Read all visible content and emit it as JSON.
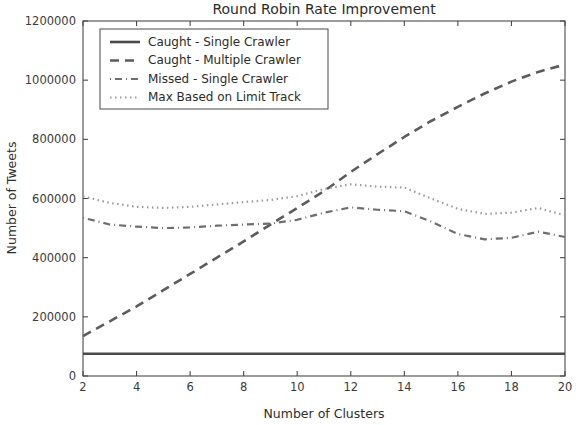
{
  "figure": {
    "width": 576,
    "height": 425,
    "background": "#ffffff"
  },
  "chart_data": {
    "type": "line",
    "title": "Round Robin Rate Improvement",
    "xlabel": "Number of Clusters",
    "ylabel": "Number of Tweets",
    "xlim": [
      2,
      20
    ],
    "ylim": [
      0,
      1200000
    ],
    "xticks": [
      2,
      4,
      6,
      8,
      10,
      12,
      14,
      16,
      18,
      20
    ],
    "xticklabels": [
      "2",
      "4",
      "6",
      "8",
      "10",
      "12",
      "14",
      "16",
      "18",
      "20"
    ],
    "yticks": [
      0,
      200000,
      400000,
      600000,
      800000,
      1000000,
      1200000
    ],
    "yticklabels": [
      "0",
      "200000",
      "400000",
      "600000",
      "800000",
      "1000000",
      "1200000"
    ],
    "grid": false,
    "legend_position": "upper left",
    "x": [
      2,
      3,
      4,
      5,
      6,
      7,
      8,
      9,
      10,
      11,
      12,
      13,
      14,
      15,
      16,
      17,
      18,
      19,
      20
    ],
    "series": [
      {
        "name": "Caught - Single Crawler",
        "linestyle": "solid",
        "color": "#4a4a4a",
        "linewidth": 2.6,
        "values": [
          75000,
          75000,
          75000,
          75000,
          75000,
          75000,
          75000,
          75000,
          75000,
          75000,
          75000,
          75000,
          75000,
          75000,
          75000,
          75000,
          75000,
          75000,
          75000
        ]
      },
      {
        "name": "Caught - Multiple Crawler",
        "linestyle": "dashed",
        "color": "#5c5c5c",
        "linewidth": 2.6,
        "values": [
          135000,
          185000,
          235000,
          290000,
          345000,
          400000,
          455000,
          512000,
          568000,
          625000,
          690000,
          750000,
          808000,
          862000,
          910000,
          955000,
          995000,
          1028000,
          1053000
        ]
      },
      {
        "name": "Missed - Single Crawler",
        "linestyle": "dashdot",
        "color": "#6e6e6e",
        "linewidth": 2.2,
        "values": [
          535000,
          512000,
          505000,
          500000,
          502000,
          508000,
          512000,
          515000,
          528000,
          552000,
          570000,
          562000,
          557000,
          522000,
          480000,
          462000,
          467000,
          488000,
          470000
        ]
      },
      {
        "name": "Max Based on Limit Track",
        "linestyle": "dotted",
        "color": "#9a9a9a",
        "linewidth": 2.2,
        "values": [
          607000,
          585000,
          572000,
          568000,
          572000,
          580000,
          588000,
          595000,
          608000,
          632000,
          648000,
          640000,
          637000,
          600000,
          565000,
          548000,
          552000,
          568000,
          543000
        ]
      }
    ]
  },
  "legend": {
    "entries": [
      {
        "label": "Caught - Single Crawler"
      },
      {
        "label": "Caught - Multiple Crawler"
      },
      {
        "label": "Missed - Single Crawler"
      },
      {
        "label": "Max Based on Limit Track"
      }
    ]
  }
}
